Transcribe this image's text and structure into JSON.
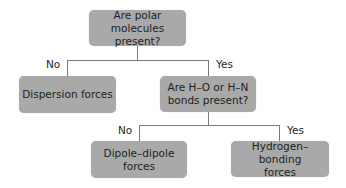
{
  "diagram": {
    "type": "decision-flowchart",
    "colors": {
      "node_fill": "#a9a9a9",
      "connector": "#7a7a7a",
      "text": "#1f1f1f",
      "background": "#ffffff"
    },
    "nodes": {
      "q1": {
        "text": "Are polar molecules\npresent?"
      },
      "dispersion": {
        "text": "Dispersion forces"
      },
      "q2": {
        "text": "Are H–O or H–N\nbonds present?"
      },
      "dipole": {
        "text": "Dipole–dipole\nforces"
      },
      "hbond": {
        "text": "Hydrogen–bonding\nforces"
      }
    },
    "edges": {
      "q1_no": {
        "label": "No",
        "from": "q1",
        "to": "dispersion"
      },
      "q1_yes": {
        "label": "Yes",
        "from": "q1",
        "to": "q2"
      },
      "q2_no": {
        "label": "No",
        "from": "q2",
        "to": "dipole"
      },
      "q2_yes": {
        "label": "Yes",
        "from": "q2",
        "to": "hbond"
      }
    }
  }
}
